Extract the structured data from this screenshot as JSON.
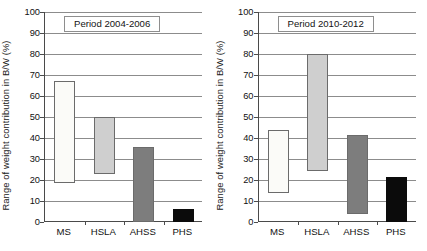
{
  "chart_data": [
    {
      "type": "bar",
      "title": "Period 2004-2006",
      "xlabel": "",
      "ylabel": "Range of weight contribution in B/W (%)",
      "ylim": [
        0,
        100
      ],
      "ytick_step": 10,
      "yticks": [
        0,
        10,
        20,
        30,
        40,
        50,
        60,
        70,
        80,
        90,
        100
      ],
      "grid": true,
      "legend": "none",
      "categories": [
        "MS",
        "HSLA",
        "AHSS",
        "PHS"
      ],
      "bar_style": "floating-range",
      "low": [
        18.7,
        23.0,
        0.0,
        0.0
      ],
      "high": [
        67.0,
        50.0,
        35.5,
        6.0
      ],
      "values": [
        48.3,
        27.0,
        35.5,
        6.0
      ],
      "colors": [
        "#fbfbf8",
        "#cfcfcf",
        "#7d7d7d",
        "#0b0b0b"
      ]
    },
    {
      "type": "bar",
      "title": "Period 2010-2012",
      "xlabel": "",
      "ylabel": "Range of weight contribution in B/W (%)",
      "ylim": [
        0,
        100
      ],
      "ytick_step": 10,
      "yticks": [
        0,
        10,
        20,
        30,
        40,
        50,
        60,
        70,
        80,
        90,
        100
      ],
      "grid": true,
      "legend": "none",
      "categories": [
        "MS",
        "HSLA",
        "AHSS",
        "PHS"
      ],
      "bar_style": "floating-range",
      "low": [
        13.8,
        24.5,
        4.0,
        0.0
      ],
      "high": [
        44.0,
        80.0,
        41.5,
        21.5
      ],
      "values": [
        30.2,
        55.5,
        37.5,
        21.5
      ],
      "colors": [
        "#fbfbf8",
        "#cfcfcf",
        "#7d7d7d",
        "#0b0b0b"
      ]
    }
  ],
  "panels": [
    {
      "title": "Period 2004-2006",
      "axis_label": "Range of weight contribution in B/W (%)",
      "ytick_labels": [
        "100",
        "90",
        "80",
        "70",
        "60",
        "50",
        "40",
        "30",
        "20",
        "10",
        "0"
      ],
      "category_labels": [
        "MS",
        "HSLA",
        "AHSS",
        "PHS"
      ]
    },
    {
      "title": "Period 2010-2012",
      "axis_label": "Range of weight contribution in B/W (%)",
      "ytick_labels": [
        "100",
        "90",
        "80",
        "70",
        "60",
        "50",
        "40",
        "30",
        "20",
        "10",
        "0"
      ],
      "category_labels": [
        "MS",
        "HSLA",
        "AHSS",
        "PHS"
      ]
    }
  ]
}
